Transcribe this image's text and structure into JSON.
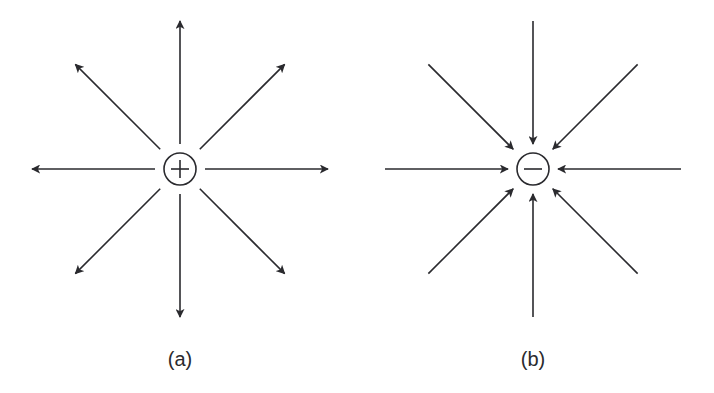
{
  "figure": {
    "line_color": "#2a2a2e",
    "background": "#ffffff",
    "panels": [
      {
        "id": "a",
        "label": "(a)",
        "charge_sign": "+",
        "charge_type": "positive",
        "field_direction": "outward",
        "line_count": 8
      },
      {
        "id": "b",
        "label": "(b)",
        "charge_sign": "−",
        "charge_type": "negative",
        "field_direction": "inward",
        "line_count": 8
      }
    ]
  }
}
